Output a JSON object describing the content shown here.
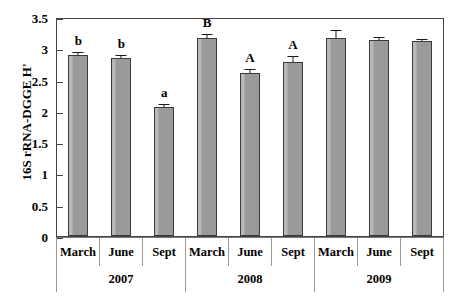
{
  "chart_data": {
    "type": "bar",
    "title": "",
    "xlabel": "",
    "ylabel": "16S rRNA-DGGE H'",
    "ylim": [
      0,
      3.5
    ],
    "ytick_labels": [
      "0",
      "0.5",
      "1",
      "1.5",
      "2",
      "2.5",
      "3",
      "3.5"
    ],
    "ytick_values": [
      0,
      0.5,
      1,
      1.5,
      2,
      2.5,
      3,
      3.5
    ],
    "grid": false,
    "legend": null,
    "groups": [
      "2007",
      "2008",
      "2009"
    ],
    "categories": [
      "March",
      "June",
      "Sept",
      "March",
      "June",
      "Sept",
      "March",
      "June",
      "Sept"
    ],
    "values": [
      2.89,
      2.84,
      2.06,
      3.16,
      2.6,
      2.78,
      3.17,
      3.13,
      3.11
    ],
    "errors": [
      0.04,
      0.03,
      0.04,
      0.06,
      0.05,
      0.08,
      0.1,
      0.04,
      0.03
    ],
    "annotations": [
      "b",
      "b",
      "a",
      "B",
      "A",
      "A",
      "",
      "",
      ""
    ],
    "bar_color": "#9a9a9a",
    "bar_edge_color": "#3a3a3a",
    "axis_color": "#444444"
  },
  "axis": {
    "month_labels": [
      "March",
      "June",
      "Sept",
      "March",
      "June",
      "Sept",
      "March",
      "June",
      "Sept"
    ],
    "year_labels": [
      "2007",
      "2008",
      "2009"
    ]
  }
}
